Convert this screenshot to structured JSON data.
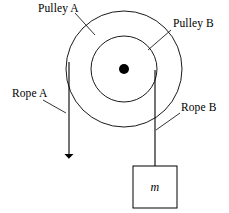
{
  "figure": {
    "background_color": "#ffffff",
    "stroke_color": "#000000",
    "width": 229,
    "height": 213
  },
  "labels": {
    "pulley_a": "Pulley A",
    "pulley_b": "Pulley B",
    "rope_a": "Rope A",
    "rope_b": "Rope B",
    "mass": "m"
  },
  "geometry": {
    "center": {
      "x": 124,
      "y": 69
    },
    "outer_pulley": {
      "name": "Pulley A",
      "radius": 58
    },
    "inner_pulley": {
      "name": "Pulley B",
      "radius": 33
    },
    "axle_dot_radius": 5,
    "rope_a": {
      "x": 69,
      "y_top": 62,
      "y_bottom": 163,
      "arrowhead": "down",
      "tangent_to": "outer_pulley"
    },
    "rope_b": {
      "x": 155,
      "y_top": 70,
      "y_bottom": 166,
      "tangent_to": "inner_pulley"
    },
    "mass_box": {
      "x": 133,
      "y": 166,
      "width": 44,
      "height": 42
    },
    "leader_lines": [
      {
        "from_label": "pulley_a",
        "x1": 75,
        "y1": 13,
        "x2": 95,
        "y2": 35
      },
      {
        "from_label": "pulley_b",
        "x1": 171,
        "y1": 30,
        "x2": 148,
        "y2": 50
      },
      {
        "from_label": "rope_a",
        "x1": 43,
        "y1": 100,
        "x2": 66,
        "y2": 113
      },
      {
        "from_label": "rope_b",
        "x1": 180,
        "y1": 113,
        "x2": 156,
        "y2": 130
      }
    ]
  }
}
